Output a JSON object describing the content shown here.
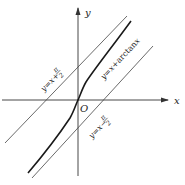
{
  "figure": {
    "axes": {
      "x_label": "x",
      "y_label": "y",
      "origin_label": "O"
    },
    "curves": [
      {
        "name": "y=x+arctan x",
        "label_prefix": "y=x+",
        "label_func": "arctan",
        "label_var": "x"
      },
      {
        "name": "y=x+π/2",
        "label": "y=x+",
        "frac_num": "π",
        "frac_den": "2"
      },
      {
        "name": "y=x−π/2",
        "label": "y=x−",
        "frac_num": "π",
        "frac_den": "2"
      }
    ],
    "colors": {
      "axis": "#333333",
      "curve": "#1a1a1a",
      "asymptote": "#444444"
    }
  }
}
